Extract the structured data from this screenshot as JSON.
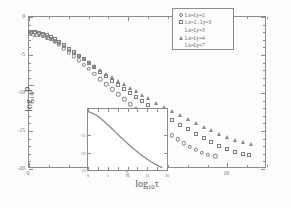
{
  "chart_data": {
    "type": "scatter",
    "title": "",
    "xlabel": "log10 tau",
    "ylabel": "log10 P_tau",
    "xlim": [
      0,
      12
    ],
    "ylim": [
      -20,
      0
    ],
    "xticks": [
      0,
      5,
      10
    ],
    "xtick_labels": [
      "0",
      "5",
      "10"
    ],
    "yticks": [
      0,
      -5,
      -10,
      -15,
      -20
    ],
    "ytick_labels": [
      "0",
      "-5",
      "-10",
      "-15",
      "-20"
    ],
    "grid": false,
    "legend_position": "top-right",
    "series": [
      {
        "name": "Lx=Ly=2",
        "marker": "circle",
        "points": [
          [
            0.1,
            -2.05
          ],
          [
            0.3,
            -2.1
          ],
          [
            0.5,
            -2.22
          ],
          [
            0.7,
            -2.38
          ],
          [
            0.9,
            -2.6
          ],
          [
            1.1,
            -2.88
          ],
          [
            1.3,
            -3.22
          ],
          [
            1.5,
            -3.6
          ],
          [
            1.75,
            -4.1
          ],
          [
            2.0,
            -4.62
          ],
          [
            2.25,
            -5.16
          ],
          [
            2.5,
            -5.7
          ],
          [
            2.75,
            -6.26
          ],
          [
            3.0,
            -6.82
          ],
          [
            3.3,
            -7.5
          ],
          [
            3.6,
            -8.18
          ],
          [
            3.9,
            -8.86
          ],
          [
            4.2,
            -9.52
          ],
          [
            4.5,
            -10.18
          ],
          [
            4.8,
            -10.84
          ],
          [
            5.1,
            -11.48
          ],
          [
            5.4,
            -12.1
          ],
          [
            5.7,
            -12.72
          ],
          [
            6.0,
            -13.32
          ],
          [
            6.3,
            -13.9
          ],
          [
            6.6,
            -14.48
          ],
          [
            6.9,
            -15.04
          ],
          [
            7.2,
            -15.58
          ],
          [
            7.5,
            -16.1
          ],
          [
            7.8,
            -16.6
          ],
          [
            8.1,
            -17.06
          ],
          [
            8.4,
            -17.48
          ],
          [
            8.7,
            -17.84
          ],
          [
            9.0,
            -18.1
          ],
          [
            9.4,
            -18.32
          ]
        ]
      },
      {
        "name": "Lx=2, Ly=3",
        "marker": "square",
        "points": [
          [
            0.1,
            -1.92
          ],
          [
            0.3,
            -1.96
          ],
          [
            0.5,
            -2.06
          ],
          [
            0.7,
            -2.2
          ],
          [
            0.9,
            -2.4
          ],
          [
            1.1,
            -2.64
          ],
          [
            1.3,
            -2.94
          ],
          [
            1.5,
            -3.26
          ],
          [
            1.75,
            -3.7
          ],
          [
            2.0,
            -4.16
          ],
          [
            2.25,
            -4.62
          ],
          [
            2.5,
            -5.1
          ],
          [
            2.75,
            -5.58
          ],
          [
            3.0,
            -6.06
          ],
          [
            3.3,
            -6.64
          ],
          [
            3.6,
            -7.22
          ],
          [
            3.9,
            -7.8
          ],
          [
            4.2,
            -8.36
          ],
          [
            4.5,
            -8.92
          ],
          [
            4.8,
            -9.48
          ],
          [
            5.1,
            -10.02
          ],
          [
            5.4,
            -10.56
          ],
          [
            5.7,
            -11.08
          ],
          [
            6.0,
            -11.6
          ],
          [
            6.4,
            -12.28
          ],
          [
            6.8,
            -12.94
          ],
          [
            7.2,
            -13.58
          ],
          [
            7.6,
            -14.2
          ],
          [
            8.0,
            -14.8
          ],
          [
            8.4,
            -15.38
          ],
          [
            8.8,
            -15.94
          ],
          [
            9.2,
            -16.46
          ],
          [
            9.6,
            -16.94
          ],
          [
            10.0,
            -17.38
          ],
          [
            10.4,
            -17.74
          ],
          [
            10.8,
            -18.0
          ],
          [
            11.1,
            -18.14
          ]
        ]
      },
      {
        "name": "Lx=Ly=4",
        "marker": "triangle",
        "points": [
          [
            0.1,
            -2.3
          ],
          [
            0.3,
            -2.32
          ],
          [
            0.5,
            -2.4
          ],
          [
            0.7,
            -2.52
          ],
          [
            0.9,
            -2.7
          ],
          [
            1.1,
            -2.92
          ],
          [
            1.3,
            -3.18
          ],
          [
            1.5,
            -3.48
          ],
          [
            1.75,
            -3.88
          ],
          [
            2.0,
            -4.3
          ],
          [
            2.25,
            -4.72
          ],
          [
            2.5,
            -5.14
          ],
          [
            2.75,
            -5.56
          ],
          [
            3.0,
            -5.98
          ],
          [
            3.3,
            -6.48
          ],
          [
            3.6,
            -6.98
          ],
          [
            3.9,
            -7.46
          ],
          [
            4.2,
            -7.94
          ],
          [
            4.5,
            -8.42
          ],
          [
            4.8,
            -8.88
          ],
          [
            5.1,
            -9.34
          ],
          [
            5.4,
            -9.8
          ],
          [
            5.7,
            -10.24
          ],
          [
            6.0,
            -10.68
          ],
          [
            6.4,
            -11.26
          ],
          [
            6.8,
            -11.82
          ],
          [
            7.2,
            -12.36
          ],
          [
            7.6,
            -12.9
          ],
          [
            8.0,
            -13.42
          ],
          [
            8.4,
            -13.92
          ],
          [
            8.8,
            -14.42
          ],
          [
            9.2,
            -14.9
          ],
          [
            9.6,
            -15.36
          ],
          [
            10.0,
            -15.78
          ],
          [
            10.4,
            -16.16
          ],
          [
            10.8,
            -16.48
          ],
          [
            11.2,
            -16.7
          ]
        ]
      }
    ],
    "legend_entries": [
      {
        "marker": "circle",
        "label": "Lx=Ly=2"
      },
      {
        "marker": "square",
        "label": "Lx=2 , Ly=3"
      },
      {
        "marker": "none",
        "label": "Lx=Ly=3"
      },
      {
        "marker": "triangle",
        "label": "Lx=Ly=4"
      },
      {
        "marker": "none",
        "label": "Lx=Ly=7"
      }
    ],
    "inset": {
      "type": "line",
      "xlim": [
        0,
        20
      ],
      "ylim": [
        -35,
        0
      ],
      "xticks": [
        0,
        5,
        10,
        15,
        20
      ],
      "xtick_labels": [
        "0",
        "5",
        "10",
        "15",
        "20"
      ],
      "yticks": [
        -15,
        -25,
        -35
      ],
      "ytick_labels": [
        "-15",
        "-25",
        "-35"
      ],
      "points": [
        [
          0.0,
          -1.5
        ],
        [
          1.0,
          -2.2
        ],
        [
          2.0,
          -3.4
        ],
        [
          3.0,
          -5.0
        ],
        [
          4.0,
          -6.9
        ],
        [
          5.0,
          -9.0
        ],
        [
          6.0,
          -11.2
        ],
        [
          7.0,
          -13.4
        ],
        [
          8.0,
          -15.6
        ],
        [
          9.0,
          -17.7
        ],
        [
          10.0,
          -19.8
        ],
        [
          11.0,
          -21.8
        ],
        [
          12.0,
          -23.7
        ],
        [
          13.0,
          -25.5
        ],
        [
          14.0,
          -27.2
        ],
        [
          15.0,
          -28.8
        ],
        [
          16.0,
          -30.3
        ],
        [
          17.0,
          -31.6
        ],
        [
          18.0,
          -32.8
        ],
        [
          18.8,
          -33.6
        ]
      ]
    }
  },
  "labels": {
    "xaxis_prefix": "log",
    "xaxis_sub": "10",
    "xaxis_var": "τ",
    "yaxis_prefix": "log",
    "yaxis_sub": "10",
    "yaxis_var": "P",
    "yaxis_var_sub": "τ"
  },
  "colors": {
    "axis": "#8c8c8c",
    "marker": "#7d7d7d",
    "inset_line": "#8a8a8a",
    "text": "#5d5d5d",
    "background": "#ffffff"
  }
}
